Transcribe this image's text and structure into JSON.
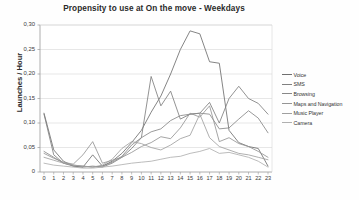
{
  "chart_data": {
    "type": "line",
    "title": "Propensity to use at On the move - Weekdays",
    "xlabel": "",
    "ylabel": "Launches / Hour",
    "grid": true,
    "legend_position": "right",
    "xlim": [
      0,
      23
    ],
    "ylim": [
      0,
      0.3
    ],
    "y_tick_labels": [
      "0,30",
      "0,25",
      "0,20",
      "0,15",
      "0,10",
      "0,05",
      "0"
    ],
    "y_tick_values": [
      0.3,
      0.25,
      0.2,
      0.15,
      0.1,
      0.05,
      0
    ],
    "categories": [
      "0",
      "1",
      "2",
      "3",
      "4",
      "5",
      "6",
      "7",
      "8",
      "9",
      "10",
      "11",
      "12",
      "13",
      "14",
      "15",
      "16",
      "17",
      "18",
      "19",
      "20",
      "21",
      "22",
      "23"
    ],
    "x": [
      0,
      1,
      2,
      3,
      4,
      5,
      6,
      7,
      8,
      9,
      10,
      11,
      12,
      13,
      14,
      15,
      16,
      17,
      18,
      19,
      20,
      21,
      22,
      23
    ],
    "series": [
      {
        "name": "Voice",
        "color": "#6f6f6f",
        "values": [
          0.12,
          0.045,
          0.022,
          0.012,
          0.01,
          0.035,
          0.012,
          0.022,
          0.038,
          0.06,
          0.085,
          0.122,
          0.155,
          0.2,
          0.25,
          0.288,
          0.282,
          0.225,
          0.222,
          0.085,
          0.06,
          0.052,
          0.048,
          0.012
        ]
      },
      {
        "name": "SMS",
        "color": "#808080",
        "values": [
          0.118,
          0.035,
          0.018,
          0.012,
          0.01,
          0.012,
          0.01,
          0.018,
          0.03,
          0.048,
          0.07,
          0.195,
          0.135,
          0.165,
          0.108,
          0.118,
          0.12,
          0.142,
          0.1,
          0.15,
          0.175,
          0.15,
          0.14,
          0.118
        ]
      },
      {
        "name": "Browsing",
        "color": "#888888",
        "values": [
          0.042,
          0.03,
          0.018,
          0.014,
          0.012,
          0.01,
          0.012,
          0.02,
          0.032,
          0.055,
          0.07,
          0.082,
          0.088,
          0.105,
          0.115,
          0.118,
          0.12,
          0.118,
          0.088,
          0.09,
          0.108,
          0.125,
          0.11,
          0.08
        ]
      },
      {
        "name": "Maps and Navigation",
        "color": "#959595",
        "values": [
          0.038,
          0.028,
          0.02,
          0.016,
          0.035,
          0.062,
          0.018,
          0.024,
          0.03,
          0.04,
          0.052,
          0.06,
          0.072,
          0.068,
          0.09,
          0.12,
          0.112,
          0.135,
          0.062,
          0.07,
          0.058,
          0.052,
          0.042,
          0.03
        ]
      },
      {
        "name": "Music Player",
        "color": "#a0a0a0",
        "values": [
          0.03,
          0.024,
          0.018,
          0.014,
          0.012,
          0.01,
          0.014,
          0.026,
          0.048,
          0.062,
          0.058,
          0.05,
          0.045,
          0.055,
          0.068,
          0.075,
          0.118,
          0.07,
          0.052,
          0.045,
          0.038,
          0.035,
          0.03,
          0.025
        ]
      },
      {
        "name": "Camera",
        "color": "#b0b0b0",
        "values": [
          0.018,
          0.014,
          0.012,
          0.01,
          0.008,
          0.008,
          0.01,
          0.012,
          0.015,
          0.018,
          0.02,
          0.022,
          0.026,
          0.03,
          0.032,
          0.038,
          0.042,
          0.048,
          0.038,
          0.04,
          0.035,
          0.03,
          0.022,
          0.01
        ]
      }
    ]
  },
  "legend": {
    "items": [
      {
        "label": "Voice"
      },
      {
        "label": "SMS"
      },
      {
        "label": "Browsing"
      },
      {
        "label": "Maps and Navigation"
      },
      {
        "label": "Music Player"
      },
      {
        "label": "Camera"
      }
    ]
  }
}
